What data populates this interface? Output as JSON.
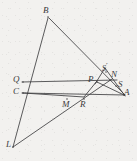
{
  "figure": {
    "kind": "geometry-diagram",
    "caption": "",
    "background_color": "#f2f1ef",
    "stroke_color": "#3f3f41",
    "label_color": "#3a3a3c",
    "width": 137,
    "height": 161
  },
  "points": [
    {
      "id": "B",
      "label": "B",
      "x": 48,
      "y": 17,
      "label_x": 43,
      "label_y": 6,
      "prime": false
    },
    {
      "id": "Q",
      "label": "Q",
      "x": 23,
      "y": 82,
      "label_x": 13,
      "label_y": 75,
      "prime": false
    },
    {
      "id": "C",
      "label": "C",
      "x": 23,
      "y": 93,
      "label_x": 13,
      "label_y": 87,
      "prime": false
    },
    {
      "id": "L",
      "label": "L",
      "x": 13,
      "y": 147,
      "label_x": 6,
      "label_y": 140,
      "prime": false
    },
    {
      "id": "M",
      "label": "M",
      "x": 67,
      "y": 99,
      "label_x": 62,
      "label_y": 100,
      "prime": false
    },
    {
      "id": "R",
      "label": "R",
      "x": 84,
      "y": 99,
      "label_x": 80,
      "label_y": 100,
      "prime": false
    },
    {
      "id": "P",
      "label": "P",
      "x": 97,
      "y": 82,
      "label_x": 88,
      "label_y": 75,
      "prime": false
    },
    {
      "id": "Sp",
      "label": "S",
      "x": 106,
      "y": 72,
      "label_x": 102,
      "label_y": 62,
      "prime": true
    },
    {
      "id": "N",
      "label": "N",
      "x": 110,
      "y": 80,
      "label_x": 111,
      "label_y": 70,
      "prime": false
    },
    {
      "id": "S",
      "label": "S",
      "x": 116,
      "y": 86,
      "label_x": 118,
      "label_y": 80,
      "prime": false
    },
    {
      "id": "A",
      "label": "A",
      "x": 124,
      "y": 95,
      "label_x": 124,
      "label_y": 88,
      "prime": false
    }
  ],
  "segments": [
    {
      "name": "segment-B-L",
      "from": "B",
      "to": "L",
      "x1": 48,
      "y1": 18,
      "x2": 13,
      "y2": 147
    },
    {
      "name": "segment-B-A",
      "from": "B",
      "to": "A",
      "x1": 49,
      "y1": 18,
      "x2": 125,
      "y2": 95
    },
    {
      "name": "segment-Q-S",
      "from": "Q",
      "to": "S",
      "x1": 22,
      "y1": 82,
      "x2": 117,
      "y2": 80
    },
    {
      "name": "segment-C-A",
      "from": "C",
      "to": "A",
      "x1": 22,
      "y1": 93,
      "x2": 125,
      "y2": 95
    },
    {
      "name": "segment-L-N",
      "from": "L",
      "to": "N",
      "x1": 13,
      "y1": 147,
      "x2": 112,
      "y2": 79
    },
    {
      "name": "segment-P-R",
      "from": "P",
      "to": "R",
      "x1": 97,
      "y1": 81,
      "x2": 84,
      "y2": 97
    },
    {
      "name": "segment-P-A",
      "from": "P",
      "to": "A",
      "x1": 97,
      "y1": 82,
      "x2": 124,
      "y2": 95
    },
    {
      "name": "segment-Sp-A",
      "from": "Sp",
      "to": "A",
      "x1": 105,
      "y1": 68,
      "x2": 125,
      "y2": 96
    },
    {
      "name": "segment-Sp-P",
      "from": "Sp",
      "to": "P",
      "x1": 105,
      "y1": 68,
      "x2": 95,
      "y2": 84
    },
    {
      "name": "segment-R-C",
      "from": "R",
      "to": "C",
      "x1": 84,
      "y1": 97,
      "x2": 23,
      "y2": 93
    }
  ]
}
